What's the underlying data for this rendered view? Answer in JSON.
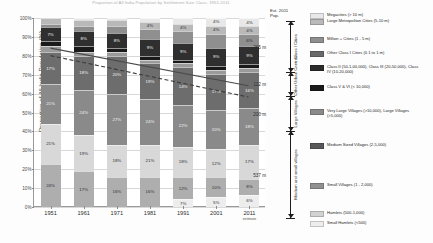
{
  "chart_data": {
    "type": "bar",
    "title": "Proportion of All India Population by Settlement Size Class, 1951-2011",
    "xlabel": "",
    "ylabel": "Proportion of All India Population (%)",
    "ylim": [
      0,
      100
    ],
    "grid": true,
    "stacked": true,
    "stack_mode": "percent",
    "legend_position": "right",
    "categories": [
      "1951",
      "1961",
      "1971",
      "1981",
      "1991",
      "2001",
      "2011"
    ],
    "x_sub_labels": [
      "",
      "",
      "",
      "",
      "",
      "",
      "estimate"
    ],
    "y_ticks": [
      "0%",
      "10%",
      "20%",
      "30%",
      "40%",
      "50%",
      "60%",
      "70%",
      "80%",
      "90%",
      "100%"
    ],
    "series": [
      {
        "name": "Megacities (> 10 m)",
        "color": "#e8e8e8",
        "values": [
          0,
          0,
          1,
          2,
          3,
          4,
          5
        ]
      },
      {
        "name": "Large Metropolitan Cities (5-10 m)",
        "color": "#b9b9b9",
        "values": [
          3,
          3,
          3,
          4,
          4,
          4,
          4
        ]
      },
      {
        "name": "Million + Cities (1 - 5 m)",
        "color": "#8f8f8f",
        "values": [
          2,
          3,
          4,
          5,
          6,
          7,
          8
        ]
      },
      {
        "name": "Other Class I Cities (0.1 to 1 m)",
        "color": "#6a6a6a",
        "values": [
          7,
          8,
          8,
          9,
          9,
          9,
          9
        ]
      },
      {
        "name": "Class II (50-1,00,000), Class III (20-50,000), Class IV (10-20,000)",
        "color": "#2b2b2b",
        "values": [
          7,
          7,
          7,
          8,
          8,
          8,
          8
        ]
      },
      {
        "name": "Class V & VI (< 10,000)",
        "color": "#1a1a1a",
        "values": [
          3,
          3,
          3,
          2,
          2,
          2,
          2
        ]
      },
      {
        "name": "Very Large Villages (>10,000), Large Villages (>5,000)",
        "color": "#7d7d7d",
        "values": [
          17,
          18,
          20,
          21,
          22,
          22,
          21
        ]
      },
      {
        "name": "Medium Sized Villages (2-5,000)",
        "color": "#585858",
        "values": [
          21,
          24,
          27,
          24,
          22,
          20,
          18
        ]
      },
      {
        "name": "Small Villages (1 - 2,000)",
        "color": "#909090",
        "values": [
          21,
          17,
          16,
          16,
          12,
          10,
          8
        ]
      },
      {
        "name": "Hamlets (500-1,000)",
        "color": "#d2d2d2",
        "values": [
          31,
          19,
          18,
          18,
          18,
          12,
          17
        ]
      },
      {
        "name": "Small Hamlets (<500)",
        "color": "#ededed",
        "values": [
          24,
          17,
          18,
          10,
          7,
          5,
          6
        ]
      }
    ],
    "bar_segments": [
      {
        "year": "1951",
        "segments": [
          {
            "label": "",
            "pct": 0,
            "color": "#e8e8e8"
          },
          {
            "label": "3%",
            "pct": 3,
            "color": "#b9b9b9"
          },
          {
            "label": "",
            "pct": 2,
            "color": "#8f8f8f"
          },
          {
            "label": "7%",
            "pct": 7,
            "color": "#2f2f2f"
          },
          {
            "label": "3%",
            "pct": 3,
            "color": "#1a1a1a"
          },
          {
            "label": "3%",
            "pct": 3,
            "color": "#9a9a9a"
          },
          {
            "label": "17%",
            "pct": 17,
            "color": "#6d6d6d"
          },
          {
            "label": "21%",
            "pct": 21,
            "color": "#8a8a8a"
          },
          {
            "label": "21%",
            "pct": 21,
            "color": "#d8d8d8"
          },
          {
            "label": "24%",
            "pct": 23,
            "color": "#aeaeae"
          }
        ]
      },
      {
        "year": "1961",
        "segments": [
          {
            "label": "",
            "pct": 1,
            "color": "#e8e8e8"
          },
          {
            "label": "3%",
            "pct": 3,
            "color": "#b9b9b9"
          },
          {
            "label": "",
            "pct": 3,
            "color": "#8f8f8f"
          },
          {
            "label": "8%",
            "pct": 8,
            "color": "#2f2f2f"
          },
          {
            "label": "3%",
            "pct": 3,
            "color": "#1a1a1a"
          },
          {
            "label": "2%",
            "pct": 2,
            "color": "#9a9a9a"
          },
          {
            "label": "18%",
            "pct": 18,
            "color": "#6d6d6d"
          },
          {
            "label": "24%",
            "pct": 24,
            "color": "#8a8a8a"
          },
          {
            "label": "19%",
            "pct": 19,
            "color": "#d8d8d8"
          },
          {
            "label": "17%",
            "pct": 19,
            "color": "#aeaeae"
          }
        ]
      },
      {
        "year": "1971",
        "segments": [
          {
            "label": "",
            "pct": 1,
            "color": "#e8e8e8"
          },
          {
            "label": "3%",
            "pct": 3,
            "color": "#b9b9b9"
          },
          {
            "label": "",
            "pct": 4,
            "color": "#8f8f8f"
          },
          {
            "label": "8%",
            "pct": 8,
            "color": "#2f2f2f"
          },
          {
            "label": "2%",
            "pct": 2,
            "color": "#1a1a1a"
          },
          {
            "label": "2%",
            "pct": 2,
            "color": "#9a9a9a"
          },
          {
            "label": "20%",
            "pct": 20,
            "color": "#6d6d6d"
          },
          {
            "label": "27%",
            "pct": 27,
            "color": "#8a8a8a"
          },
          {
            "label": "18%",
            "pct": 17,
            "color": "#d8d8d8"
          },
          {
            "label": "16%",
            "pct": 16,
            "color": "#aeaeae"
          }
        ]
      },
      {
        "year": "1981",
        "segments": [
          {
            "label": "4%",
            "pct": 2,
            "color": "#e8e8e8"
          },
          {
            "label": "4%",
            "pct": 4,
            "color": "#b9b9b9"
          },
          {
            "label": "",
            "pct": 5,
            "color": "#8f8f8f"
          },
          {
            "label": "9%",
            "pct": 9,
            "color": "#2f2f2f"
          },
          {
            "label": "2%",
            "pct": 2,
            "color": "#1a1a1a"
          },
          {
            "label": "2%",
            "pct": 2,
            "color": "#9a9a9a"
          },
          {
            "label": "19%",
            "pct": 19,
            "color": "#6d6d6d"
          },
          {
            "label": "24%",
            "pct": 24,
            "color": "#8a8a8a"
          },
          {
            "label": "21%",
            "pct": 17,
            "color": "#d8d8d8"
          },
          {
            "label": "16%",
            "pct": 16,
            "color": "#aeaeae"
          }
        ]
      },
      {
        "year": "1991",
        "segments": [
          {
            "label": "4%",
            "pct": 3,
            "color": "#e8e8e8"
          },
          {
            "label": "4%",
            "pct": 4,
            "color": "#b9b9b9"
          },
          {
            "label": "",
            "pct": 6,
            "color": "#8f8f8f"
          },
          {
            "label": "9%",
            "pct": 9,
            "color": "#2f2f2f"
          },
          {
            "label": "2%",
            "pct": 2,
            "color": "#1a1a1a"
          },
          {
            "label": "2%",
            "pct": 2,
            "color": "#9a9a9a"
          },
          {
            "label": "14%",
            "pct": 20,
            "color": "#6d6d6d"
          },
          {
            "label": "22%",
            "pct": 22,
            "color": "#8a8a8a"
          },
          {
            "label": "18%",
            "pct": 16,
            "color": "#d8d8d8"
          },
          {
            "label": "12%",
            "pct": 12,
            "color": "#aeaeae"
          },
          {
            "label": "7%",
            "pct": 4,
            "color": "#ededed"
          }
        ]
      },
      {
        "year": "2001",
        "segments": [
          {
            "label": "4%",
            "pct": 4,
            "color": "#e8e8e8"
          },
          {
            "label": "4%",
            "pct": 4,
            "color": "#b9b9b9"
          },
          {
            "label": "",
            "pct": 7,
            "color": "#8f8f8f"
          },
          {
            "label": "9%",
            "pct": 9,
            "color": "#2f2f2f"
          },
          {
            "label": "2%",
            "pct": 2,
            "color": "#1a1a1a"
          },
          {
            "label": "2%",
            "pct": 2,
            "color": "#9a9a9a"
          },
          {
            "label": "17%",
            "pct": 18,
            "color": "#6d6d6d"
          },
          {
            "label": "20%",
            "pct": 20,
            "color": "#8a8a8a"
          },
          {
            "label": "12%",
            "pct": 14,
            "color": "#d8d8d8"
          },
          {
            "label": "10%",
            "pct": 10,
            "color": "#aeaeae"
          },
          {
            "label": "5%",
            "pct": 5,
            "color": "#ededed"
          }
        ]
      },
      {
        "year": "2011",
        "segments": [
          {
            "label": "4%",
            "pct": 4,
            "color": "#e8e8e8"
          },
          {
            "label": "4%",
            "pct": 4,
            "color": "#b9b9b9"
          },
          {
            "label": "6%",
            "pct": 6,
            "color": "#8f8f8f"
          },
          {
            "label": "9%",
            "pct": 9,
            "color": "#2f2f2f"
          },
          {
            "label": "2%",
            "pct": 2,
            "color": "#1a1a1a"
          },
          {
            "label": "2%",
            "pct": 2,
            "color": "#9a9a9a"
          },
          {
            "label": "16%",
            "pct": 18,
            "color": "#6d6d6d"
          },
          {
            "label": "18%",
            "pct": 18,
            "color": "#8a8a8a"
          },
          {
            "label": "17%",
            "pct": 17,
            "color": "#d8d8d8"
          },
          {
            "label": "8%",
            "pct": 8,
            "color": "#aeaeae"
          },
          {
            "label": "6%",
            "pct": 6,
            "color": "#ededed"
          }
        ]
      },
      {
        "year": "1951",
        "segments": []
      }
    ],
    "trend_lines": [
      {
        "name": "urban-share-trend",
        "style": "solid",
        "color": "#4a4a4a",
        "points": [
          [
            0,
            84
          ],
          [
            6,
            64
          ]
        ]
      },
      {
        "name": "village-share-trend",
        "style": "dashed",
        "color": "#3a3a3a",
        "points": [
          [
            0,
            80
          ],
          [
            6,
            58
          ]
        ]
      }
    ],
    "annotations": {
      "header_line1": "Est. 2011",
      "header_line2": "Pop.",
      "groups": [
        {
          "label": "Class I Cities",
          "value": "265 m",
          "top_pct": 100,
          "bottom_pct": 74
        },
        {
          "label": "Other Urban Centres",
          "value": "112 m",
          "top_pct": 74,
          "bottom_pct": 62
        },
        {
          "label": "Large Villages",
          "value": "200 m",
          "top_pct": 62,
          "bottom_pct": 44
        },
        {
          "label": "Medium and small villages",
          "value": "537 m",
          "top_pct": 44,
          "bottom_pct": 0
        }
      ]
    },
    "legend_entries": [
      {
        "color": "#e8e8e8",
        "text": "Megacities (> 10 m)",
        "top": 0
      },
      {
        "color": "#b9b9b9",
        "text": "Large Metropolitan Cities (5-10 m)",
        "top": 6
      },
      {
        "color": "#8f8f8f",
        "text": "Million + Cities (1 - 5 m)",
        "top": 24
      },
      {
        "color": "#6a6a6a",
        "text": "Other Class I Cities (0.1 to 1 m)",
        "top": 38
      },
      {
        "color": "#2b2b2b",
        "text": "Class II (50-1,00,000), Class III (20-50,000), Class\nIV (10-20,000)",
        "top": 52
      },
      {
        "color": "#1a1a1a",
        "text": "Class V & VI (< 10,000)",
        "top": 72
      },
      {
        "color": "#8a8a8a",
        "text": "Very Large Villages (>10,000), Large Villages\n(>5,000)",
        "top": 96
      },
      {
        "color": "#585858",
        "text": "Medium Sized Villages (2-5,000)",
        "top": 130
      },
      {
        "color": "#909090",
        "text": "Small Villages (1 - 2,000)",
        "top": 170
      },
      {
        "color": "#d2d2d2",
        "text": "Hamlets (500-1,000)",
        "top": 198
      },
      {
        "color": "#ededed",
        "text": "Small Hamlets (<500)",
        "top": 208
      }
    ]
  }
}
